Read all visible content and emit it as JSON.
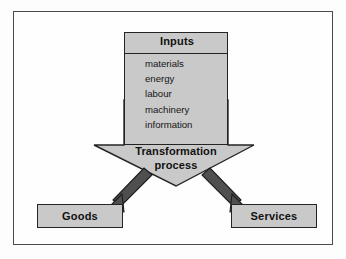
{
  "figure": {
    "type": "transformation-process-diagram",
    "frame": {
      "border_color": "#4a4a4a",
      "background": "#fefefe"
    },
    "palette": {
      "shape_fill": "#c9c9c9",
      "shape_outline": "#242424",
      "text": "#111111",
      "page_background": "#fdfdfd"
    }
  },
  "inputs": {
    "title": "Inputs",
    "items": [
      "materials",
      "energy",
      "labour",
      "machinery",
      "information"
    ]
  },
  "process": {
    "line1": "Transformation",
    "line2": "process",
    "shape": "down-arrow"
  },
  "outputs": [
    {
      "label": "Goods"
    },
    {
      "label": "Services"
    }
  ],
  "connectors": [
    {
      "from": "transformation-process",
      "to": "Goods",
      "direction": "down-left"
    },
    {
      "from": "transformation-process",
      "to": "Services",
      "direction": "down-right"
    }
  ]
}
